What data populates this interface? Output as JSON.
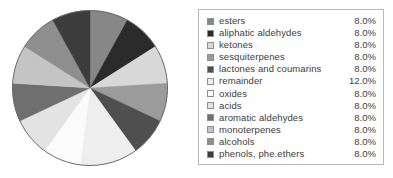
{
  "chart_data": {
    "type": "pie",
    "title": "",
    "subtitle": "",
    "xlabel": "",
    "ylabel": "",
    "grid": false,
    "legend_position": "right",
    "start_angle_deg": 0,
    "direction": "clockwise",
    "value_suffix": "%",
    "categories": [
      "esters",
      "aliphatic aldehydes",
      "ketones",
      "sesquiterpenes",
      "lactones and coumarins",
      "remainder",
      "oxides",
      "acids",
      "aromatic aldehydes",
      "monoterpenes",
      "alcohols",
      "phenols, phe.ethers"
    ],
    "values": [
      8.0,
      8.0,
      8.0,
      8.0,
      8.0,
      12.0,
      8.0,
      8.0,
      8.0,
      8.0,
      8.0,
      8.0
    ],
    "value_labels": [
      "8.0%",
      "8.0%",
      "8.0%",
      "8.0%",
      "8.0%",
      "12.0%",
      "8.0%",
      "8.0%",
      "8.0%",
      "8.0%",
      "8.0%",
      "8.0%"
    ],
    "slice_colors": [
      "#878787",
      "#2b2b2b",
      "#d8d8d8",
      "#9b9b9b",
      "#4f4f4f",
      "#eeeeee",
      "#fbfbfb",
      "#e3e3e3",
      "#6f6f6f",
      "#c4c4c4",
      "#8e8e8e",
      "#3c3c3c"
    ],
    "total": 100.0,
    "outline_color": "#6b6b6b",
    "legend_border_color": "#b9b9b9",
    "legend_text_color": "#3c3c3c",
    "background_color": "#ffffff"
  },
  "legend": {
    "items": [
      {
        "label": "esters",
        "value": "8.0%",
        "color": "#878787"
      },
      {
        "label": "aliphatic aldehydes",
        "value": "8.0%",
        "color": "#2b2b2b"
      },
      {
        "label": "ketones",
        "value": "8.0%",
        "color": "#d8d8d8"
      },
      {
        "label": "sesquiterpenes",
        "value": "8.0%",
        "color": "#9b9b9b"
      },
      {
        "label": "lactones and coumarins",
        "value": "8.0%",
        "color": "#4f4f4f"
      },
      {
        "label": "remainder",
        "value": "12.0%",
        "color": "#eeeeee"
      },
      {
        "label": "oxides",
        "value": "8.0%",
        "color": "#fbfbfb"
      },
      {
        "label": "acids",
        "value": "8.0%",
        "color": "#e3e3e3"
      },
      {
        "label": "aromatic aldehydes",
        "value": "8.0%",
        "color": "#6f6f6f"
      },
      {
        "label": "monoterpenes",
        "value": "8.0%",
        "color": "#c4c4c4"
      },
      {
        "label": "alcohols",
        "value": "8.0%",
        "color": "#8e8e8e"
      },
      {
        "label": "phenols, phe.ethers",
        "value": "8.0%",
        "color": "#3c3c3c"
      }
    ]
  }
}
